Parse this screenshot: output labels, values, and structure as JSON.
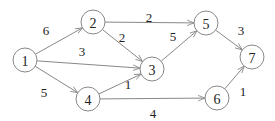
{
  "diagram": {
    "type": "weighted-directed-graph",
    "nodes": [
      {
        "id": "1",
        "label": "1",
        "x": 25,
        "y": 60
      },
      {
        "id": "2",
        "label": "2",
        "x": 93,
        "y": 22
      },
      {
        "id": "3",
        "label": "3",
        "x": 152,
        "y": 69
      },
      {
        "id": "4",
        "label": "4",
        "x": 88,
        "y": 99
      },
      {
        "id": "5",
        "label": "5",
        "x": 206,
        "y": 23
      },
      {
        "id": "6",
        "label": "6",
        "x": 217,
        "y": 98
      },
      {
        "id": "7",
        "label": "7",
        "x": 252,
        "y": 57
      }
    ],
    "edges": [
      {
        "from": "1",
        "to": "2",
        "weight": "6",
        "lx": 46,
        "ly": 30
      },
      {
        "from": "1",
        "to": "3",
        "weight": "3",
        "lx": 82,
        "ly": 51
      },
      {
        "from": "1",
        "to": "4",
        "weight": "5",
        "lx": 44,
        "ly": 92
      },
      {
        "from": "2",
        "to": "5",
        "weight": "2",
        "lx": 149,
        "ly": 17
      },
      {
        "from": "2",
        "to": "3",
        "weight": "2",
        "lx": 122,
        "ly": 37
      },
      {
        "from": "3",
        "to": "5",
        "weight": "5",
        "lx": 173,
        "ly": 36
      },
      {
        "from": "4",
        "to": "3",
        "weight": "1",
        "lx": 128,
        "ly": 84
      },
      {
        "from": "4",
        "to": "6",
        "weight": "4",
        "lx": 153,
        "ly": 113
      },
      {
        "from": "5",
        "to": "7",
        "weight": "3",
        "lx": 241,
        "ly": 30
      },
      {
        "from": "6",
        "to": "7",
        "weight": "1",
        "lx": 243,
        "ly": 91
      }
    ],
    "node_radius": 12,
    "colors": {
      "stroke": "#888888",
      "text": "#222222",
      "background": "#ffffff"
    }
  }
}
